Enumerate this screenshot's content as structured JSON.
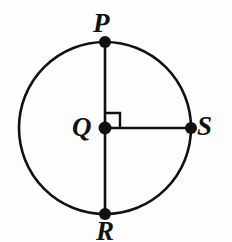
{
  "figure": {
    "kind": "circle-geometry-diagram",
    "background_color": "#fdfdfd",
    "stroke_color": "#111111",
    "labels": {
      "top": "P",
      "right": "S",
      "center": "Q",
      "bottom": "R"
    },
    "geometry": {
      "center": {
        "x": 105,
        "y": 128
      },
      "radius": 86,
      "circle_stroke_width": 2.6,
      "segment_stroke_width": 2.6,
      "points": [
        {
          "name": "P",
          "x": 105,
          "y": 42,
          "role": "top-point-on-circle",
          "dot_radius": 6
        },
        {
          "name": "S",
          "x": 191,
          "y": 128,
          "role": "right-point-on-circle",
          "dot_radius": 6
        },
        {
          "name": "Q",
          "x": 105,
          "y": 128,
          "role": "center-point",
          "dot_radius": 6.5
        },
        {
          "name": "R",
          "x": 105,
          "y": 214,
          "role": "bottom-point-on-circle",
          "dot_radius": 6
        }
      ],
      "segments": [
        {
          "name": "diameter-PR",
          "from": "P",
          "to": "R"
        },
        {
          "name": "radius-QS",
          "from": "Q",
          "to": "S"
        }
      ],
      "right_angle_marker": {
        "at": "Q",
        "between": [
          "QP",
          "QS"
        ],
        "size": 15,
        "stroke_width": 2.4
      }
    }
  }
}
